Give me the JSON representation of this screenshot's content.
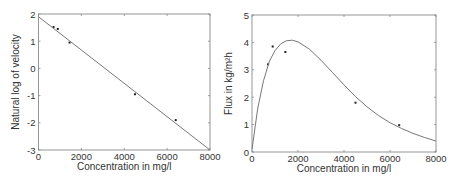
{
  "chart_data": [
    {
      "type": "scatter",
      "title": "",
      "xlabel": "Concentration in mg/l",
      "ylabel": "Natural log of velocity",
      "xlim": [
        0,
        8000
      ],
      "ylim": [
        -3,
        2
      ],
      "xticks": [
        "0",
        "2000",
        "4000",
        "6000",
        "8000"
      ],
      "yticks": [
        "-3",
        "-2",
        "-1",
        "0",
        "1",
        "2"
      ],
      "grid": false,
      "series": [
        {
          "name": "data",
          "style": "points",
          "x": [
            700,
            900,
            1450,
            4500,
            6400
          ],
          "y": [
            1.52,
            1.45,
            0.95,
            -0.95,
            -1.9
          ]
        },
        {
          "name": "fit",
          "style": "line",
          "x": [
            0,
            8000
          ],
          "y": [
            1.9,
            -3.0
          ]
        }
      ]
    },
    {
      "type": "scatter",
      "title": "",
      "xlabel": "Concentration in mg/l",
      "ylabel": "Flux in kg/m²h",
      "xlim": [
        0,
        8000
      ],
      "ylim": [
        0,
        5
      ],
      "xticks": [
        "0",
        "2000",
        "4000",
        "6000",
        "8000"
      ],
      "yticks": [
        "0",
        "1",
        "2",
        "3",
        "4",
        "5"
      ],
      "grid": false,
      "series": [
        {
          "name": "data",
          "style": "points",
          "x": [
            700,
            900,
            1450,
            4500,
            6400
          ],
          "y": [
            3.2,
            3.85,
            3.65,
            1.8,
            0.98
          ]
        },
        {
          "name": "model",
          "style": "line",
          "x": [
            0,
            250,
            500,
            750,
            1000,
            1250,
            1500,
            1750,
            2000,
            2500,
            3000,
            3500,
            4000,
            4500,
            5000,
            5500,
            6000,
            6500,
            7000,
            7500,
            8000
          ],
          "y": [
            0.1,
            1.6,
            2.6,
            3.3,
            3.7,
            3.95,
            4.06,
            4.08,
            4.02,
            3.75,
            3.35,
            2.9,
            2.45,
            2.02,
            1.65,
            1.33,
            1.07,
            0.86,
            0.68,
            0.53,
            0.4
          ]
        }
      ]
    }
  ]
}
